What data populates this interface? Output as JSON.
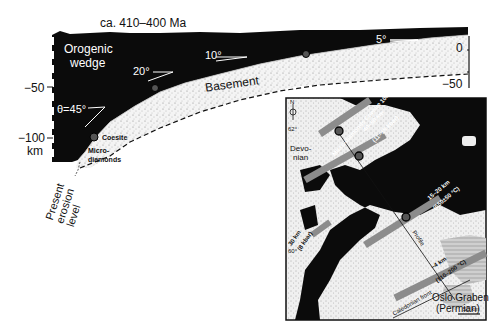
{
  "title": "ca. 410–400 Ma",
  "cross_section": {
    "wedge_label_line1": "Orogenic",
    "wedge_label_line2": "wedge",
    "basement_label": "Basement",
    "angles": [
      "θ=45°",
      "20°",
      "10°",
      "5°"
    ],
    "left_axis": {
      "ticks": [
        "−50",
        "−100"
      ],
      "unit": "km"
    },
    "right_axis": {
      "ticks": [
        "0",
        "−50"
      ]
    },
    "coesite_label": "Coesite",
    "microdiamonds_line1": "Micro-",
    "microdiamonds_line2": "diamonds",
    "erosion_label_line1": "Present",
    "erosion_label_line2": "erosion",
    "erosion_label_line3": "level"
  },
  "inset_map": {
    "north_label": "N",
    "lat_labels": [
      "62°",
      "60°"
    ],
    "devonian_label_line1": "Devo-",
    "devonian_label_line2": "nian",
    "bands": [
      {
        "depth": "Micro-diamonds Coesite 100 km",
        "pressure": "(30 kbar)"
      },
      {
        "depth": "40–50 km",
        "pressure": "(11–15 kbar)"
      },
      {
        "depth": "15–20 km",
        "pressure": "(550±50 °C)"
      },
      {
        "depth": "30 km",
        "pressure": "(8 kbar)"
      },
      {
        "depth": "~4 km",
        "pressure": "(110–200 °C)"
      }
    ],
    "profile_label": "Profile",
    "caledonian_front_label": "Caledonian front",
    "oslo_label_line1": "Oslo Graben",
    "oslo_label_line2": "(Permian)",
    "scale_label": "50 km"
  },
  "colors": {
    "wedge": "#0a0a0a",
    "basement": "#f2f2f2",
    "band": "#8c8c8c",
    "marker": "#555555"
  }
}
